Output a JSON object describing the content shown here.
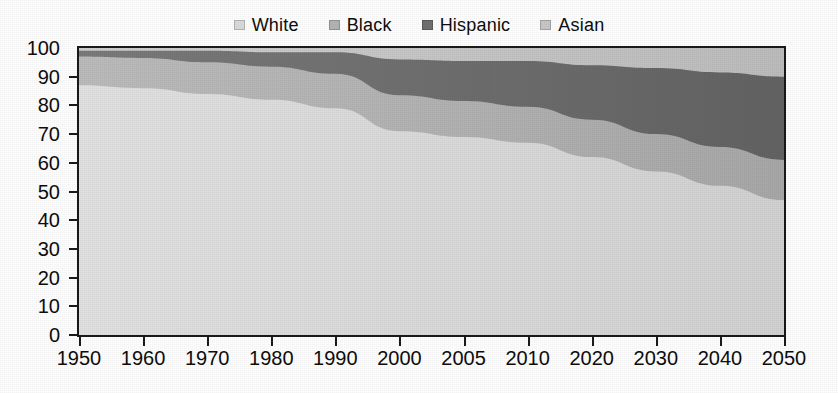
{
  "chart_data": {
    "type": "area",
    "stacked": true,
    "stack_mode": "percent",
    "title": "",
    "subtitle": "",
    "xlabel": "",
    "ylabel": "",
    "ylim": [
      0,
      100
    ],
    "ytick_step": 10,
    "grid": false,
    "legend_position": "top-center",
    "categories": [
      "1950",
      "1960",
      "1970",
      "1980",
      "1990",
      "2000",
      "2005",
      "2010",
      "2020",
      "2030",
      "2040",
      "2050"
    ],
    "yticks": [
      "100",
      "90",
      "80",
      "70",
      "60",
      "50",
      "40",
      "30",
      "20",
      "10",
      "0"
    ],
    "series": [
      {
        "name": "White",
        "color": "#dcdcdc",
        "values": [
          87,
          86,
          84,
          82,
          79,
          71,
          69,
          67,
          62,
          57,
          52,
          47
        ]
      },
      {
        "name": "Black",
        "color": "#b4b4b4",
        "values": [
          10,
          10.5,
          11,
          11.5,
          12,
          12.5,
          12.5,
          12.5,
          13,
          13,
          13.5,
          14
        ]
      },
      {
        "name": "Hispanic",
        "color": "#707070",
        "values": [
          2,
          2.5,
          4,
          5,
          7.5,
          12.5,
          14,
          16,
          19,
          23,
          26,
          29
        ]
      },
      {
        "name": "Asian",
        "color": "#c8c8c8",
        "values": [
          1,
          1,
          1,
          1.5,
          1.5,
          4,
          4.5,
          4.5,
          6,
          7,
          8.5,
          10
        ]
      }
    ],
    "cumulative_tops": {
      "White": [
        87,
        86,
        84,
        82,
        79,
        71,
        69,
        67,
        62,
        57,
        52,
        47
      ],
      "Black": [
        97,
        96.5,
        95,
        93.5,
        91,
        83.5,
        81.5,
        79.5,
        75,
        70,
        65.5,
        61
      ],
      "Hispanic": [
        99,
        99,
        99,
        98.5,
        98.5,
        96,
        95.5,
        95.5,
        94,
        93,
        91.5,
        90
      ],
      "Asian": [
        100,
        100,
        100,
        100,
        100,
        100,
        100,
        100,
        100,
        100,
        100,
        100
      ]
    }
  },
  "legend": {
    "entries": [
      {
        "label": "White",
        "color": "#dcdcdc",
        "swatch_name": "legend-swatch-white"
      },
      {
        "label": "Black",
        "color": "#b4b4b4",
        "swatch_name": "legend-swatch-black"
      },
      {
        "label": "Hispanic",
        "color": "#707070",
        "swatch_name": "legend-swatch-hispanic"
      },
      {
        "label": "Asian",
        "color": "#c8c8c8",
        "swatch_name": "legend-swatch-asian"
      }
    ]
  },
  "colors": {
    "axis": "#1a1a1a",
    "text": "#0d0d0d",
    "background": "#ffffff",
    "white_band": "#dcdcdc",
    "black_band": "#b4b4b4",
    "hispanic_band": "#707070",
    "asian_band": "#c8c8c8"
  }
}
